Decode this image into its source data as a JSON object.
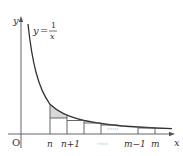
{
  "figure": {
    "type": "function-graph",
    "curve_label": {
      "lhs": "y",
      "eq": "=",
      "numerator": "1",
      "denominator": "x"
    },
    "axis_labels": {
      "x": "x",
      "y": "y",
      "origin": "O"
    },
    "tick_labels": [
      {
        "id": "n",
        "text": "n"
      },
      {
        "id": "n1",
        "text": "n+1"
      },
      {
        "id": "dots",
        "text": "······"
      },
      {
        "id": "m1",
        "text": "m−1"
      },
      {
        "id": "m",
        "text": "m"
      }
    ],
    "middle_dots": "······",
    "colors": {
      "line": "#333333",
      "shade": "#d9d9d9",
      "background": "#ffffff"
    }
  }
}
